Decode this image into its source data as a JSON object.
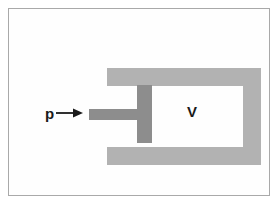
{
  "figure": {
    "background_color": "#ffffff",
    "frame": {
      "name": "figure-border",
      "color": "#a9a9a9"
    },
    "labels": {
      "pressure": "p",
      "volume": "V"
    },
    "arrow": {
      "name": "pressure-arrow",
      "direction": "right",
      "glyph": "→",
      "color": "#1a1a1a"
    },
    "colors": {
      "wall": "#b2b2b2",
      "piston": "#8d8d8d",
      "chamber": "#ffffff",
      "label_text": "#1a1a1a",
      "frame_border": "#a9a9a9"
    },
    "parts": [
      {
        "name": "cylinder-wall-top",
        "color": "#b2b2b2"
      },
      {
        "name": "cylinder-wall-bottom",
        "color": "#b2b2b2"
      },
      {
        "name": "cylinder-wall-right",
        "color": "#b2b2b2"
      },
      {
        "name": "piston-head",
        "color": "#8d8d8d"
      },
      {
        "name": "piston-rod",
        "color": "#8d8d8d"
      }
    ]
  }
}
